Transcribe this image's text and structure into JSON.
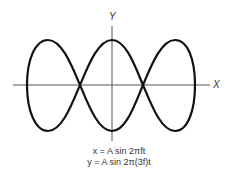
{
  "figure": {
    "axis_x_label": "X",
    "axis_y_label": "Y",
    "equations": [
      "x = A sin 2πft",
      "y = A sin 2π(3f)t"
    ],
    "curve_color": "#111111",
    "axis_color": "#555555"
  }
}
